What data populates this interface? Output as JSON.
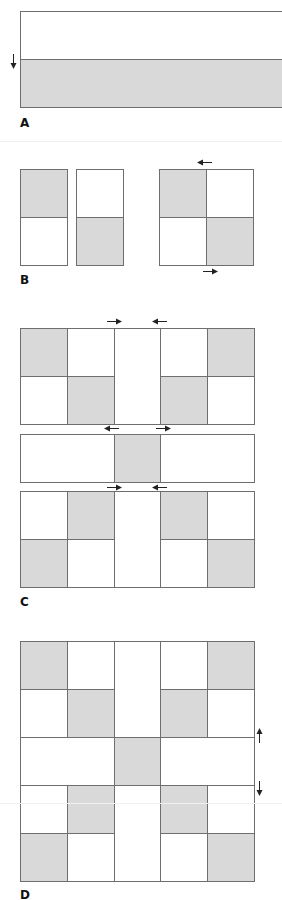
{
  "colors": {
    "fill": "#d9d9d9",
    "border": "#6e6e6e",
    "background": "#ffffff",
    "arrow": "#222222"
  },
  "panels": {
    "a": {
      "label": "A",
      "arrows": [
        "down"
      ]
    },
    "b": {
      "label": "B",
      "arrows": [
        "left",
        "right"
      ]
    },
    "c": {
      "label": "C",
      "arrows": [
        "right",
        "left",
        "left",
        "right",
        "right",
        "left"
      ]
    },
    "d": {
      "label": "D",
      "arrows": [
        "up",
        "down"
      ]
    }
  }
}
